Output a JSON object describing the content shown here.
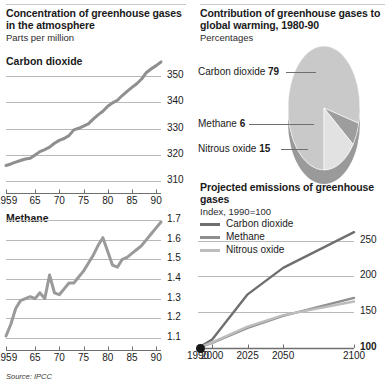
{
  "panels": {
    "concentration": {
      "title": "Concentration of greenhouse gases in the atmosphere",
      "subtitle": "Parts per million",
      "co2_label": "Carbon dioxide",
      "methane_label": "Methane"
    },
    "contribution": {
      "title": "Contribution of greenhouse gases to global warming, 1980-90",
      "subtitle": "Percentages"
    },
    "projection": {
      "title": "Projected emissions of greenhouse gases",
      "subtitle": "Index, 1990=100"
    }
  },
  "source": "Source: IPCC",
  "colors": {
    "dark_line": "#6f6f6f",
    "mid_line": "#8f8f8f",
    "light_line": "#bdbdbd",
    "pie_top": "#c9c9c9",
    "pie_side": "#9a9a9a",
    "pie_wedge_mid": "#9d9d9d",
    "pie_wedge_light": "#e2e2e2",
    "gridline": "#b9b9b9",
    "text": "#1a1a1a"
  },
  "chart_data": [
    {
      "type": "line",
      "id": "co2-concentration",
      "title": "Carbon dioxide",
      "subtitle": "Parts per million",
      "xlabel": "",
      "ylabel": "",
      "ylim": [
        310,
        355
      ],
      "yticks": [
        310,
        320,
        330,
        340,
        350
      ],
      "ytick_labels": [
        "310",
        "320",
        "330",
        "340",
        "350"
      ],
      "xlim": [
        1959,
        1991
      ],
      "xticks": [
        1959,
        1965,
        1970,
        1975,
        1980,
        1985,
        1990
      ],
      "xtick_labels": [
        "1959",
        "65",
        "70",
        "75",
        "80",
        "85",
        "90"
      ],
      "grid": true,
      "series": [
        {
          "name": "Carbon dioxide",
          "color": "#8f8f8f",
          "x": [
            1959,
            1960,
            1961,
            1962,
            1963,
            1964,
            1965,
            1966,
            1967,
            1968,
            1969,
            1970,
            1971,
            1972,
            1973,
            1974,
            1975,
            1976,
            1977,
            1978,
            1979,
            1980,
            1981,
            1982,
            1983,
            1984,
            1985,
            1986,
            1987,
            1988,
            1989,
            1990,
            1991
          ],
          "values": [
            315.9,
            316.5,
            317.2,
            317.8,
            318.4,
            318.7,
            319.9,
            321.2,
            322.0,
            322.9,
            324.4,
            325.5,
            326.2,
            327.3,
            329.5,
            330.1,
            330.9,
            331.8,
            333.6,
            335.2,
            336.6,
            338.5,
            339.8,
            340.8,
            342.6,
            344.2,
            345.7,
            347.1,
            348.9,
            351.4,
            352.8,
            354.0,
            355.4
          ]
        }
      ]
    },
    {
      "type": "line",
      "id": "methane-concentration",
      "title": "Methane",
      "subtitle": "Parts per million",
      "xlabel": "",
      "ylabel": "",
      "ylim": [
        1.1,
        1.7
      ],
      "yticks": [
        1.1,
        1.2,
        1.3,
        1.4,
        1.5,
        1.6,
        1.7
      ],
      "ytick_labels": [
        "1.1",
        "1.2",
        "1.3",
        "1.4",
        "1.5",
        "1.6",
        "1.7"
      ],
      "xlim": [
        1959,
        1991
      ],
      "xticks": [
        1959,
        1965,
        1970,
        1975,
        1980,
        1985,
        1990
      ],
      "xtick_labels": [
        "1959",
        "65",
        "70",
        "75",
        "80",
        "85",
        "90"
      ],
      "grid": true,
      "series": [
        {
          "name": "Methane",
          "color": "#9a9a9a",
          "x": [
            1959,
            1960,
            1961,
            1962,
            1963,
            1964,
            1965,
            1966,
            1967,
            1968,
            1969,
            1970,
            1971,
            1972,
            1973,
            1974,
            1975,
            1976,
            1977,
            1978,
            1979,
            1980,
            1981,
            1982,
            1983,
            1984,
            1985,
            1986,
            1987,
            1988,
            1989,
            1990,
            1991
          ],
          "values": [
            1.11,
            1.17,
            1.25,
            1.29,
            1.3,
            1.31,
            1.3,
            1.33,
            1.3,
            1.42,
            1.33,
            1.32,
            1.35,
            1.38,
            1.38,
            1.41,
            1.44,
            1.48,
            1.52,
            1.57,
            1.61,
            1.54,
            1.47,
            1.46,
            1.5,
            1.51,
            1.53,
            1.55,
            1.57,
            1.6,
            1.63,
            1.66,
            1.69
          ]
        }
      ]
    },
    {
      "type": "pie",
      "id": "contribution-to-warming",
      "title": "Contribution of greenhouse gases to global warming, 1980-90",
      "subtitle": "Percentages",
      "unit": "%",
      "labels": [
        "Carbon dioxide",
        "Methane",
        "Nitrous oxide"
      ],
      "values": [
        79,
        6,
        15
      ],
      "value_labels": [
        "79",
        "6",
        "15"
      ],
      "colors": [
        "#c9c9c9",
        "#9d9d9d",
        "#e2e2e2"
      ],
      "three_d": true
    },
    {
      "type": "line",
      "id": "projected-emissions",
      "title": "Projected emissions of greenhouse gases",
      "subtitle": "Index, 1990=100",
      "xlabel": "",
      "ylabel": "",
      "ylim": [
        100,
        265
      ],
      "yticks": [
        100,
        150,
        200,
        250
      ],
      "ytick_labels": [
        "100",
        "150",
        "200",
        "250"
      ],
      "xlim": [
        1990,
        2100
      ],
      "xticks": [
        1990,
        2000,
        2025,
        2050,
        2100
      ],
      "xtick_labels": [
        "1990",
        "2000",
        "2025",
        "2050",
        "2100"
      ],
      "grid": true,
      "legend": [
        "Carbon dioxide",
        "Methane",
        "Nitrous oxide"
      ],
      "legend_position": "top-left",
      "origin_marker": true,
      "series": [
        {
          "name": "Carbon dioxide",
          "color": "#6f6f6f",
          "x": [
            1990,
            2000,
            2025,
            2050,
            2100
          ],
          "values": [
            100,
            112,
            175,
            212,
            262
          ]
        },
        {
          "name": "Methane",
          "color": "#8f8f8f",
          "x": [
            1990,
            2000,
            2025,
            2050,
            2100
          ],
          "values": [
            100,
            107,
            128,
            145,
            170
          ]
        },
        {
          "name": "Nitrous oxide",
          "color": "#bdbdbd",
          "x": [
            1990,
            2000,
            2025,
            2050,
            2100
          ],
          "values": [
            100,
            108,
            130,
            146,
            165
          ]
        }
      ]
    }
  ],
  "legend_rows": [
    {
      "label": "Carbon dioxide",
      "color": "#6f6f6f"
    },
    {
      "label": "Methane",
      "color": "#8f8f8f"
    },
    {
      "label": "Nitrous oxide",
      "color": "#bdbdbd"
    }
  ],
  "pie_callouts": [
    {
      "label": "Carbon dioxide",
      "value": "79"
    },
    {
      "label": "Methane",
      "value": "6"
    },
    {
      "label": "Nitrous oxide",
      "value": "15"
    }
  ]
}
